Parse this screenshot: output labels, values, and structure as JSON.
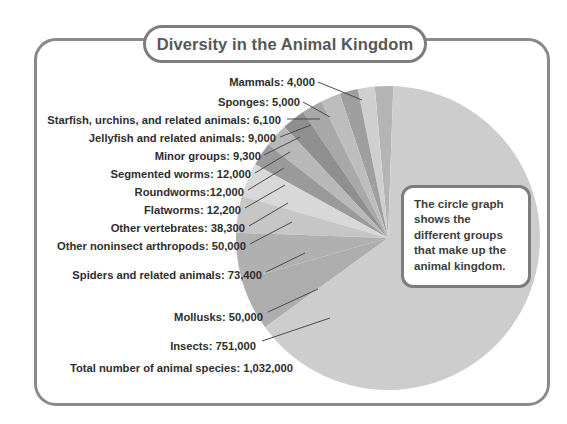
{
  "figure": {
    "title": "Diversity in the Animal Kingdom",
    "total_label": "Total number of animal species:  1,032,000",
    "callout": "The circle graph shows the different groups that make up the animal kingdom."
  },
  "chart_data": {
    "type": "pie",
    "title": "Diversity in the Animal Kingdom",
    "total": 1032000,
    "total_label": "Total number of animal species:  1,032,000",
    "unit": "number of species",
    "legend": "labels with leader lines",
    "categories": [
      "Mammals",
      "Sponges",
      "Starfish, urchins, and related animals",
      "Jellyfish and related animals",
      "Minor groups",
      "Segmented worms",
      "Roundworms",
      "Flatworms",
      "Other vertebrates",
      "Other noninsect arthropods",
      "Spiders and related animals",
      "Mollusks",
      "Insects"
    ],
    "values": [
      4000,
      5000,
      6100,
      9000,
      9300,
      12000,
      12000,
      12200,
      38300,
      50000,
      73400,
      50000,
      751000
    ],
    "labels": [
      "Mammals: 4,000",
      "Sponges: 5,000",
      "Starfish, urchins, and related animals: 6,100",
      "Jellyfish and related animals: 9,000",
      "Minor groups: 9,300",
      "Segmented worms: 12,000",
      "Roundworms:12,000",
      "Flatworms:  12,200",
      "Other vertebrates: 38,300",
      "Other noninsect arthropods: 50,000",
      "Spiders and related animals: 73,400",
      "Mollusks: 50,000",
      "Insects: 751,000"
    ],
    "slice_colors": [
      "#b4b4b4",
      "#cfcfcf",
      "#9e9e9e",
      "#bdbdbd",
      "#a8a8a8",
      "#8f8f8f",
      "#b8b8b8",
      "#9a9a9a",
      "#d8d8d8",
      "#c6c6c6",
      "#b0b0b0",
      "#adadad",
      "#cdcdcd"
    ]
  },
  "colors": {
    "frame_border": "#8a8a8a",
    "title_text": "#575757",
    "label_text": "#2e2e2e",
    "leader_line": "#4a4a4a",
    "background": "#ffffff"
  }
}
